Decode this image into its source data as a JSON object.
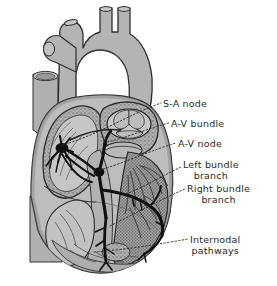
{
  "figure": {
    "style": "grayscale anatomical line illustration, cutaway coronal section",
    "background_color": "#ffffff",
    "ink_color": "#2a2a2a",
    "tissue_fill": "#b4b4b4",
    "chamber_fill": "#c9c9c9",
    "muscle_fill": "#a0a0a0",
    "conduction_color": "#141414",
    "leader_style": "dotted"
  },
  "labels": [
    {
      "id": "sa-node",
      "text": "S-A node",
      "line2": ""
    },
    {
      "id": "av-bundle",
      "text": "A-V bundle",
      "line2": ""
    },
    {
      "id": "av-node",
      "text": "A-V node",
      "line2": ""
    },
    {
      "id": "left-bundle",
      "text": "Left bundle",
      "line2": "branch"
    },
    {
      "id": "right-bundle",
      "text": "Right bundle",
      "line2": "branch"
    },
    {
      "id": "internodal",
      "text": "Internodal",
      "line2": "pathways"
    }
  ],
  "anatomy": {
    "great_vessels": [
      "brachiocephalic trunk",
      "left common carotid artery",
      "left subclavian artery"
    ],
    "structures": [
      "aortic arch",
      "ascending aorta",
      "superior vena cava",
      "inferior vena cava",
      "right atrium",
      "right ventricle",
      "left atrium",
      "left ventricle",
      "interventricular septum",
      "aortic valve cusps",
      "papillary muscles",
      "trabeculae carneae",
      "Purkinje fiber network"
    ]
  }
}
